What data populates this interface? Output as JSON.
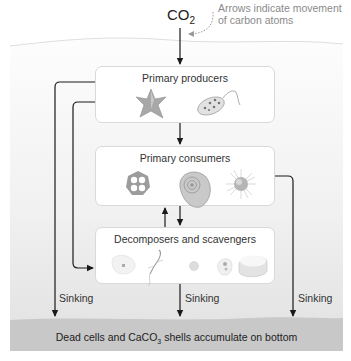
{
  "diagram": {
    "top_input": {
      "formula_main": "CO",
      "formula_sub": "2"
    },
    "note": {
      "line1": "Arrows indicate movement",
      "line2": "of carbon atoms"
    },
    "boxes": [
      {
        "title": "Primary producers",
        "organisms": [
          "star-shaped-diatom",
          "dinoflagellate-flagellate"
        ]
      },
      {
        "title": "Primary consumers",
        "organisms": [
          "lattice-radiolarian",
          "foraminiferan-shell",
          "spiny-radiolarian"
        ]
      },
      {
        "title": "Decomposers and scavengers",
        "organisms": [
          "bacterium-cell",
          "copepod-larva",
          "small-cell",
          "ciliate",
          "calcium-carbonate-shell-fragment"
        ]
      }
    ],
    "sinking_labels": [
      "Sinking",
      "Sinking",
      "Sinking"
    ],
    "bottom": {
      "text_before": "Dead cells and CaCO",
      "text_sub": "3",
      "text_after": " shells accumulate on bottom"
    },
    "colors": {
      "water_top": "#fbfbfb",
      "water_bottom": "#e8e8e8",
      "sediment": "#c9c9c9",
      "arrow": "#1a1a1a",
      "note_arrow": "#9a9a9a"
    }
  }
}
